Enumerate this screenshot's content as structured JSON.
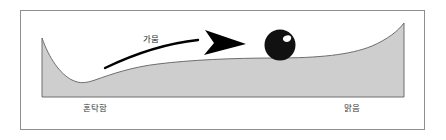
{
  "figure": {
    "type": "conceptual-stability-landscape",
    "frame": {
      "border_color": "#8f8f8f",
      "background": "#ffffff"
    },
    "landscape": {
      "fill_color": "#cecece",
      "stroke_color": "#6e6e6e",
      "description": "bistable potential landscape with deep left valley and shallow right basin"
    },
    "ball": {
      "name": "state-ball",
      "fill_color": "#111111",
      "highlight_color": "#ffffff",
      "diameter_px": 30
    },
    "arrow": {
      "name": "transition-arrow",
      "color": "#000000",
      "label": "가뭄",
      "direction": "left-to-right"
    },
    "labels": {
      "left": "혼탁함",
      "right": "맑음"
    }
  }
}
